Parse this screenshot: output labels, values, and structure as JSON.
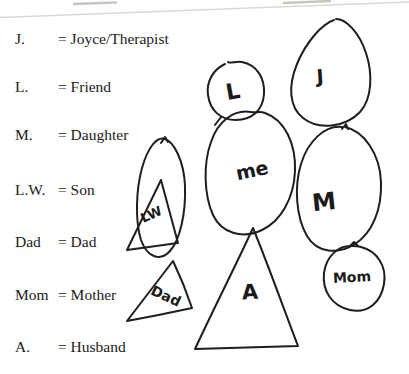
{
  "page": {
    "background": "#ffffff",
    "ink_color": "#1e1e1e",
    "page_edge_color": "#dcd9d4"
  },
  "legend": {
    "rows": [
      {
        "key": "J.",
        "value": "= Joyce/Therapist"
      },
      {
        "key": "L.",
        "value": "= Friend"
      },
      {
        "key": "M.",
        "value": "= Daughter"
      },
      {
        "key": "L.W.",
        "value": "= Son"
      },
      {
        "key": "Dad",
        "value": "= Dad"
      },
      {
        "key": "Mom",
        "value": "= Mother"
      },
      {
        "key": "A.",
        "value": "= Husband"
      }
    ]
  },
  "diagram": {
    "shapes": [
      {
        "id": "friend",
        "label": "L",
        "form": "circle"
      },
      {
        "id": "therapist",
        "label": "J",
        "form": "circle"
      },
      {
        "id": "me",
        "label": "me",
        "form": "oval"
      },
      {
        "id": "daughter",
        "label": "M",
        "form": "oval"
      },
      {
        "id": "son",
        "label": "LW",
        "form": "oval-and-triangle"
      },
      {
        "id": "dad",
        "label": "Dad",
        "form": "triangle"
      },
      {
        "id": "husband",
        "label": "A",
        "form": "triangle"
      },
      {
        "id": "mother",
        "label": "Mom",
        "form": "circle"
      }
    ]
  }
}
